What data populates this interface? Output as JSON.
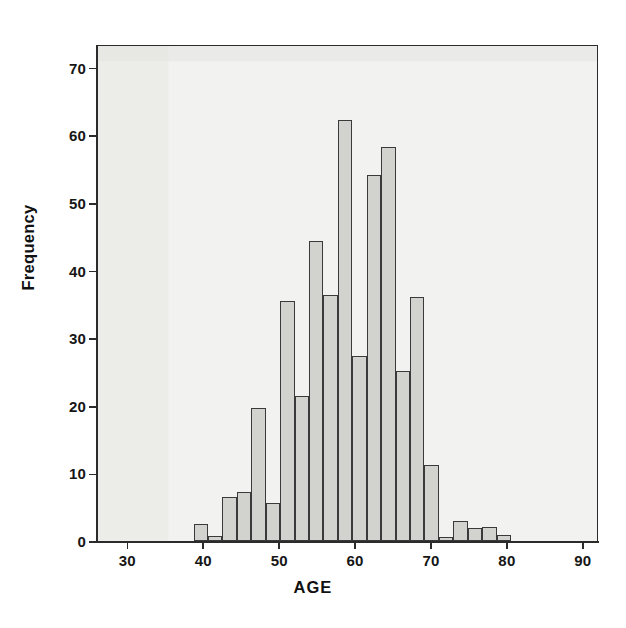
{
  "chart_data": {
    "type": "bar",
    "title": "",
    "xlabel": "AGE",
    "ylabel": "Frequency",
    "xlim": [
      26,
      92
    ],
    "ylim": [
      0,
      73.5
    ],
    "grid": false,
    "legend": null,
    "bin_width": 1.9,
    "xticks": [
      30,
      40,
      50,
      60,
      70,
      80,
      90
    ],
    "yticks": [
      0,
      10,
      20,
      30,
      40,
      50,
      60,
      70
    ],
    "xtick_labels": [
      "30",
      "40",
      "50",
      "60",
      "70",
      "80",
      "90"
    ],
    "ytick_labels": [
      "0",
      "10",
      "20",
      "30",
      "40",
      "50",
      "60",
      "70"
    ],
    "bin_starts": [
      38.6,
      40.5,
      42.4,
      44.3,
      46.2,
      48.1,
      50.0,
      51.9,
      53.8,
      55.7,
      57.6,
      59.5,
      61.4,
      63.3,
      65.2,
      67.1,
      69.0,
      70.9,
      72.8,
      74.7,
      76.6,
      78.5
    ],
    "categories": [
      "38.6-40.5",
      "40.5-42.4",
      "42.4-44.3",
      "44.3-46.2",
      "46.2-48.1",
      "48.1-50.0",
      "50.0-51.9",
      "51.9-53.8",
      "53.8-55.7",
      "55.7-57.6",
      "57.6-59.5",
      "59.5-61.4",
      "61.4-63.3",
      "63.3-65.2",
      "65.2-67.1",
      "67.1-69.0",
      "69.0-70.9",
      "70.9-72.8",
      "72.8-74.7",
      "74.7-76.6",
      "76.6-78.5",
      "78.5-80.4"
    ],
    "values": [
      2.5,
      0.8,
      6.5,
      7.3,
      19.6,
      5.6,
      35.5,
      21.4,
      44.4,
      36.4,
      62.3,
      27.3,
      54.2,
      58.2,
      25.2,
      36.1,
      11.3,
      0.6,
      3.0,
      1.9,
      2.1,
      0.9
    ],
    "extra_bars": [
      {
        "start": 76.6,
        "value": 1.1
      },
      {
        "start": 78.5,
        "value": 1.1
      }
    ],
    "bar_face_color": "#d2d2cf",
    "bar_edge_color": "#3a3a3a",
    "plot_background": "#f2f2f0",
    "axis_color": "#2b2b2b",
    "peak_value": 62,
    "peak_bin": "55.7-57.6"
  }
}
